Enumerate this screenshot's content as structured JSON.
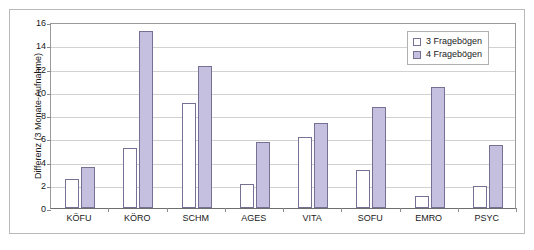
{
  "chart_data": {
    "type": "bar",
    "title": "",
    "xlabel": "",
    "ylabel": "Differenz (3 Monate-Aufnahme)",
    "ylim": [
      0,
      16
    ],
    "ytick_values": [
      0,
      2,
      4,
      6,
      8,
      10,
      12,
      14,
      16
    ],
    "ytick_labels": [
      "0",
      "2",
      "4",
      "6",
      "8",
      "10",
      "12",
      "14",
      "16"
    ],
    "grid": true,
    "grid_axis": "y",
    "legend_position": "top-right",
    "categories": [
      "KÖFU",
      "KÖRO",
      "SCHM",
      "AGES",
      "VITA",
      "SOFU",
      "EMRO",
      "PSYC"
    ],
    "series": [
      {
        "name": "3 Fragebögen",
        "color": "#ffffff",
        "edge_color": "#777094",
        "values": [
          2.5,
          5.2,
          9.0,
          2.1,
          6.1,
          3.3,
          1.0,
          1.9
        ]
      },
      {
        "name": "4 Fragebögen",
        "color": "#c5c0e0",
        "edge_color": "#777094",
        "values": [
          3.5,
          15.2,
          12.2,
          5.7,
          7.3,
          8.7,
          10.4,
          5.4
        ]
      }
    ]
  },
  "legend": {
    "entries": [
      {
        "label": "3 Fragebögen"
      },
      {
        "label": "4 Fragebögen"
      }
    ]
  },
  "colors": {
    "series_1_fill": "#ffffff",
    "series_2_fill": "#c5c0e0",
    "bar_edge": "#777094",
    "gridline": "#d2d2d2",
    "axis_line": "#9a9a9a",
    "frame_border": "#b9b9b9",
    "text": "#1a1a1a"
  }
}
